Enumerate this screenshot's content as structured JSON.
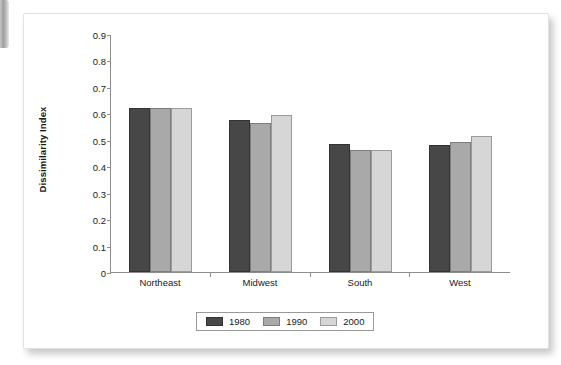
{
  "chart_data": {
    "type": "bar",
    "title": "",
    "xlabel": "",
    "ylabel": "Dissimilarity Index",
    "categories": [
      "Northeast",
      "Midwest",
      "South",
      "West"
    ],
    "series": [
      {
        "name": "1980",
        "color": "#474747",
        "values": [
          0.62,
          0.573,
          0.483,
          0.481
        ]
      },
      {
        "name": "1990",
        "color": "#a9a9a9",
        "values": [
          0.62,
          0.562,
          0.463,
          0.492
        ]
      },
      {
        "name": "2000",
        "color": "#d6d6d6",
        "values": [
          0.62,
          0.593,
          0.463,
          0.513
        ]
      }
    ],
    "ylim": [
      0,
      0.9
    ],
    "ytick_labels": [
      "0.9",
      "0.8",
      "0.7",
      "0.6",
      "0.5",
      "0.4",
      "0.3",
      "0.2",
      "0.1",
      "0"
    ],
    "ytick_values": [
      0.9,
      0.8,
      0.7,
      0.6,
      0.5,
      0.4,
      0.3,
      0.2,
      0.1,
      0
    ],
    "grid": false,
    "legend_position": "bottom"
  }
}
